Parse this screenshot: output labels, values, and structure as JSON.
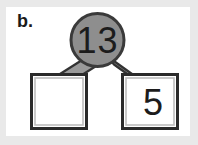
{
  "figure": {
    "part_label": "b.",
    "type": "number-bond",
    "whole": {
      "value": "13",
      "shape": "circle",
      "fill_color": "#8e8e8e",
      "border_color": "#3a3a3a",
      "text_color": "#1c1c1c"
    },
    "parts": [
      {
        "position": "left",
        "value": "",
        "is_blank": true,
        "shape": "square",
        "fill_color": "#ffffff",
        "border_color": "#2b2b2b",
        "inner_border_color": "#bdbdbd"
      },
      {
        "position": "right",
        "value": "5",
        "is_blank": false,
        "shape": "square",
        "fill_color": "#ffffff",
        "border_color": "#2b2b2b",
        "inner_border_color": "#bdbdbd"
      }
    ],
    "connectors": {
      "count": 2,
      "fill_color": "#9a9a9a",
      "stroke_color": "#333333"
    },
    "frame": {
      "margin_color": "#e9e9e9",
      "canvas_color": "#ffffff"
    }
  }
}
